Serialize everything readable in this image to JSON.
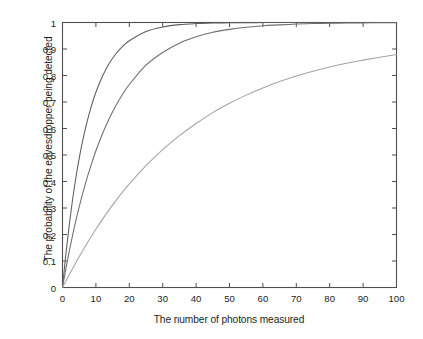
{
  "chart_data": {
    "type": "line",
    "title": "",
    "xlabel": "The number of photons measured",
    "ylabel": "The probability of the eavesdropper being detected",
    "xlim": [
      0,
      100
    ],
    "ylim": [
      0,
      1
    ],
    "grid": false,
    "legend": "none",
    "frame": "box",
    "xticks": [
      0,
      10,
      20,
      30,
      40,
      50,
      60,
      70,
      80,
      90,
      100
    ],
    "xtick_labels": [
      "0",
      "10",
      "20",
      "30",
      "40",
      "50",
      "60",
      "70",
      "80",
      "90",
      "100"
    ],
    "yticks": [
      0,
      0.1,
      0.2,
      0.3,
      0.4,
      0.5,
      0.6,
      0.7,
      0.8,
      0.9,
      1
    ],
    "ytick_labels": [
      "0",
      "0.1",
      "0.2",
      "0.3",
      "0.4",
      "0.5",
      "0.6",
      "0.7",
      "0.8",
      "0.9",
      "1"
    ],
    "x": [
      0,
      1,
      2,
      3,
      4,
      5,
      6,
      7,
      8,
      9,
      10,
      12,
      14,
      16,
      18,
      20,
      25,
      30,
      35,
      40,
      45,
      50,
      55,
      60,
      65,
      70,
      75,
      80,
      85,
      90,
      95,
      100
    ],
    "series": [
      {
        "name": "steep-curve",
        "color": "#5d5d5d",
        "values": [
          0,
          0.125,
          0.234,
          0.33,
          0.414,
          0.487,
          0.551,
          0.607,
          0.656,
          0.699,
          0.737,
          0.798,
          0.846,
          0.882,
          0.91,
          0.931,
          0.966,
          0.983,
          0.992,
          0.996,
          0.998,
          0.999,
          0.9995,
          0.9997,
          0.9999,
          0.9999,
          1,
          1,
          1,
          1,
          1,
          1
        ]
      },
      {
        "name": "middle-curve",
        "color": "#6e6e6e",
        "values": [
          0,
          0.07,
          0.135,
          0.196,
          0.252,
          0.304,
          0.353,
          0.398,
          0.44,
          0.479,
          0.516,
          0.581,
          0.638,
          0.687,
          0.729,
          0.766,
          0.839,
          0.887,
          0.922,
          0.946,
          0.963,
          0.974,
          0.982,
          0.988,
          0.991,
          0.994,
          0.996,
          0.997,
          0.998,
          0.9985,
          0.999,
          0.999
        ]
      },
      {
        "name": "shallow-curve",
        "color": "#a3a3a3",
        "values": [
          0,
          0.024,
          0.048,
          0.071,
          0.094,
          0.116,
          0.138,
          0.159,
          0.18,
          0.2,
          0.22,
          0.258,
          0.294,
          0.328,
          0.361,
          0.391,
          0.46,
          0.52,
          0.573,
          0.619,
          0.66,
          0.695,
          0.726,
          0.753,
          0.777,
          0.798,
          0.816,
          0.832,
          0.846,
          0.858,
          0.869,
          0.879
        ]
      }
    ]
  },
  "figure": {
    "background_color": "#ffffff",
    "axis_color": "#4f4f4f",
    "text_color": "#231f20"
  }
}
